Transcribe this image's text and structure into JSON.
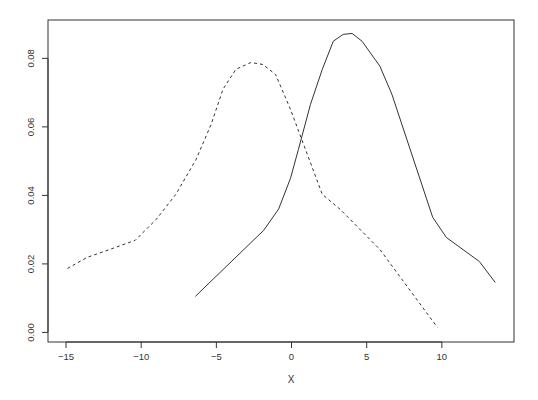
{
  "chart_data": {
    "type": "line",
    "title": "",
    "xlabel": "X",
    "ylabel": "",
    "xlim": [
      -16.2,
      14.8
    ],
    "ylim": [
      -0.0028,
      0.0912
    ],
    "xticks": [
      -15,
      -10,
      -5,
      0,
      5,
      10
    ],
    "xtick_labels": [
      "−15",
      "−10",
      "−5",
      "0",
      "5",
      "10"
    ],
    "yticks": [
      0.0,
      0.02,
      0.04,
      0.06,
      0.08
    ],
    "ytick_labels": [
      "0.00",
      "0.02",
      "0.04",
      "0.06",
      "0.08"
    ],
    "grid": false,
    "legend": null,
    "series": [
      {
        "name": "solid",
        "style": "solid",
        "color": "#333333",
        "x": [
          -6.4,
          -1.85,
          -0.86,
          -0.07,
          0.46,
          1.26,
          2.05,
          2.78,
          3.44,
          4.03,
          4.69,
          5.88,
          6.68,
          9.39,
          10.3,
          12.5,
          13.55
        ],
        "y": [
          0.0105,
          0.0298,
          0.036,
          0.045,
          0.0534,
          0.0666,
          0.0768,
          0.085,
          0.087,
          0.0873,
          0.085,
          0.0777,
          0.0695,
          0.0336,
          0.0277,
          0.0207,
          0.0146
        ]
      },
      {
        "name": "dashed",
        "style": "dashed",
        "color": "#333333",
        "x": [
          -14.9,
          -13.6,
          -12.1,
          -10.4,
          -9.0,
          -7.7,
          -6.35,
          -5.35,
          -4.56,
          -3.7,
          -2.7,
          -1.9,
          -1.06,
          -0.07,
          0.93,
          2.05,
          3.24,
          5.88,
          9.7
        ],
        "y": [
          0.0187,
          0.0219,
          0.0242,
          0.0269,
          0.033,
          0.0403,
          0.0505,
          0.0607,
          0.071,
          0.0768,
          0.0788,
          0.0782,
          0.0753,
          0.0651,
          0.0534,
          0.0403,
          0.0359,
          0.0242,
          0.0015
        ]
      }
    ]
  }
}
